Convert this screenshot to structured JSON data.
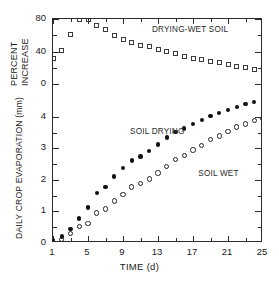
{
  "chart_data": {
    "type": "scatter",
    "title": "",
    "xlabel": "TIME (d)",
    "ylabel_primary": "DAILY CROP EVAPORATION (mm)",
    "ylabel_secondary_line1": "PERCENT",
    "ylabel_secondary_line2": "INCREASE",
    "grid": false,
    "legend_position": "in-plot annotations",
    "xlim": [
      1,
      25
    ],
    "xticks": [
      1,
      5,
      9,
      13,
      17,
      21,
      25
    ],
    "xtick_labels": [
      "1",
      "5",
      "9",
      "13",
      "17",
      "21",
      "25"
    ],
    "x_minor_ticks": [
      3,
      7,
      11,
      15,
      19,
      23
    ],
    "ylim_primary_mm": [
      0,
      4.6
    ],
    "yticks_primary_mm": [
      0,
      1,
      2,
      3,
      4
    ],
    "ytick_labels_primary": [
      "0",
      "1",
      "2",
      "3",
      "4"
    ],
    "y_minor_ticks_primary_mm": [
      0.5,
      1.5,
      2.5,
      3.5
    ],
    "ylim_secondary_percent": [
      0,
      80
    ],
    "yticks_secondary_percent": [
      0,
      40,
      80
    ],
    "ytick_labels_secondary": [
      "0",
      "40",
      "80"
    ],
    "y_minor_ticks_secondary_percent": [
      20,
      60
    ],
    "axis_split_note": "Upper portion of the left spine is the PERCENT INCREASE scale (0 to 80); lower portion is the DAILY CROP EVAPORATION scale (0 to 4 mm).",
    "series": [
      {
        "name": "DRYING-WET SOIL",
        "marker": "open-square",
        "axis": "percent",
        "unit": "%",
        "x": [
          1,
          2,
          3,
          4,
          5,
          6,
          7,
          8,
          9,
          10,
          11,
          12,
          13,
          14,
          15,
          16,
          17,
          18,
          19,
          20,
          21,
          22,
          23,
          24,
          25
        ],
        "values": [
          32,
          41,
          61,
          79,
          79,
          72,
          67,
          60,
          55,
          51,
          48,
          46,
          42,
          40,
          37,
          34,
          32,
          30,
          28,
          26,
          24,
          22,
          20,
          18,
          17
        ]
      },
      {
        "name": "SOIL DRYING",
        "marker": "filled-circle",
        "axis": "mm",
        "unit": "mm",
        "x": [
          1,
          2,
          3,
          4,
          5,
          6,
          7,
          8,
          9,
          10,
          11,
          12,
          13,
          14,
          15,
          16,
          17,
          18,
          19,
          20,
          21,
          22,
          23,
          24,
          25
        ],
        "values": [
          0.08,
          0.2,
          0.45,
          0.78,
          1.12,
          1.58,
          1.78,
          2.11,
          2.38,
          2.62,
          2.75,
          2.92,
          3.12,
          3.35,
          3.52,
          3.63,
          3.78,
          3.9,
          4.02,
          4.12,
          4.22,
          4.32,
          4.4,
          4.48,
          4.52
        ]
      },
      {
        "name": "SOIL WET",
        "marker": "open-circle",
        "axis": "mm",
        "unit": "mm",
        "x": [
          1,
          2,
          3,
          4,
          5,
          6,
          7,
          8,
          9,
          10,
          11,
          12,
          13,
          14,
          15,
          16,
          17,
          18,
          19,
          20,
          21,
          22,
          23,
          24,
          25
        ],
        "values": [
          0.02,
          0.12,
          0.3,
          0.52,
          0.62,
          0.95,
          1.08,
          1.33,
          1.53,
          1.78,
          1.88,
          2.03,
          2.22,
          2.42,
          2.65,
          2.78,
          2.95,
          3.1,
          3.28,
          3.4,
          3.54,
          3.68,
          3.78,
          3.88,
          3.95
        ]
      }
    ],
    "annotations": [
      {
        "text": "DRYING-WET SOIL",
        "x": 12.3,
        "y": 67,
        "axis": "percent"
      },
      {
        "text": "SOIL DRYING",
        "x": 9.8,
        "y": 3.52,
        "axis": "mm"
      },
      {
        "text": "SOIL WET",
        "x": 17.6,
        "y": 2.18,
        "axis": "mm"
      }
    ],
    "colors": {
      "axis": "#2b2b2b",
      "marker_open": "#222222",
      "marker_filled": "#111111",
      "text": "#1a1a1a",
      "background": "#ffffff"
    }
  }
}
